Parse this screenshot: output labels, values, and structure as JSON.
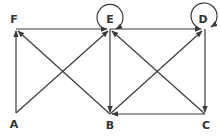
{
  "diagram": {
    "type": "directed-graph",
    "nodes": [
      {
        "id": "F",
        "label": "F",
        "x": 16,
        "y": 29,
        "label_x": 14,
        "label_y": 22
      },
      {
        "id": "E",
        "label": "E",
        "x": 110,
        "y": 29,
        "label_x": 110,
        "label_y": 23
      },
      {
        "id": "D",
        "label": "D",
        "x": 204,
        "y": 29,
        "label_x": 203,
        "label_y": 23
      },
      {
        "id": "A",
        "label": "A",
        "x": 16,
        "y": 113,
        "label_x": 14,
        "label_y": 127
      },
      {
        "id": "B",
        "label": "B",
        "x": 110,
        "y": 114,
        "label_x": 110,
        "label_y": 128
      },
      {
        "id": "C",
        "label": "C",
        "x": 205,
        "y": 114,
        "label_x": 206,
        "label_y": 128
      }
    ],
    "edges": [
      {
        "from": "A",
        "to": "F"
      },
      {
        "from": "F",
        "to": "E"
      },
      {
        "from": "A",
        "to": "E"
      },
      {
        "from": "B",
        "to": "F"
      },
      {
        "from": "E",
        "to": "B"
      },
      {
        "from": "E",
        "to": "D"
      },
      {
        "from": "B",
        "to": "D"
      },
      {
        "from": "C",
        "to": "E"
      },
      {
        "from": "D",
        "to": "C"
      },
      {
        "from": "C",
        "to": "B"
      }
    ],
    "self_loops": [
      "E",
      "D"
    ],
    "colors": {
      "stroke": "#3a3a3a",
      "label": "#333333",
      "background": "#ffffff"
    }
  }
}
